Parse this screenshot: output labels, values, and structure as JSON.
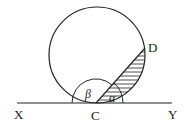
{
  "diagram": {
    "labels": {
      "X": "X",
      "Y": "Y",
      "C": "C",
      "D": "D",
      "alpha": "α",
      "beta": "β"
    },
    "colors": {
      "stroke": "#222222",
      "background": "#ffffff"
    }
  }
}
